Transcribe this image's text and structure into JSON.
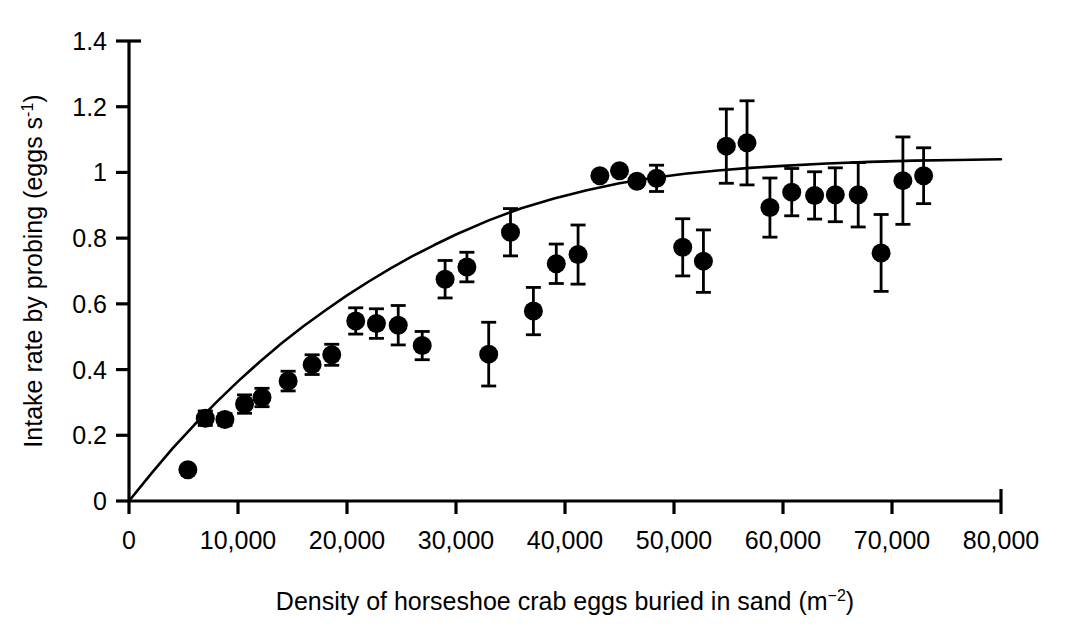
{
  "chart_data": {
    "type": "scatter",
    "title": "",
    "xlabel": "Density of horseshoe crab eggs buried in sand (m−2)",
    "ylabel": "Intake rate by probing (eggs s−1)",
    "xlabel_main": "Density of horseshoe crab eggs buried in sand (m",
    "xlabel_sup": "−2",
    "xlabel_tail": ")",
    "ylabel_main": "Intake rate by probing (eggs s",
    "ylabel_sup": "-1",
    "ylabel_tail": ")",
    "xlim": [
      0,
      80000
    ],
    "ylim": [
      0,
      1.4
    ],
    "grid": false,
    "legend": null,
    "xticks": [
      0,
      10000,
      20000,
      30000,
      40000,
      50000,
      60000,
      70000,
      80000
    ],
    "xticklabels": [
      "0",
      "10,000",
      "20,000",
      "30,000",
      "40,000",
      "50,000",
      "60,000",
      "70,000",
      "80,000"
    ],
    "yticks": [
      0,
      0.2,
      0.4,
      0.6,
      0.8,
      1.0,
      1.2,
      1.4
    ],
    "yticklabels": [
      "0",
      "0.2",
      "0.4",
      "0.6",
      "0.8",
      "1",
      "1.2",
      "1.4"
    ],
    "marker": "filled-circle",
    "marker_color": "#000000",
    "errorbar_type": "symmetric-vertical",
    "series": [
      {
        "name": "Intake rate by probing",
        "points": [
          {
            "x": 5400,
            "y": 0.095,
            "err": 0.0
          },
          {
            "x": 7000,
            "y": 0.252,
            "err": 0.022
          },
          {
            "x": 8800,
            "y": 0.248,
            "err": 0.018
          },
          {
            "x": 10600,
            "y": 0.295,
            "err": 0.028
          },
          {
            "x": 12200,
            "y": 0.315,
            "err": 0.028
          },
          {
            "x": 14600,
            "y": 0.365,
            "err": 0.03
          },
          {
            "x": 16800,
            "y": 0.415,
            "err": 0.03
          },
          {
            "x": 18600,
            "y": 0.445,
            "err": 0.032
          },
          {
            "x": 20800,
            "y": 0.548,
            "err": 0.04
          },
          {
            "x": 22700,
            "y": 0.54,
            "err": 0.045
          },
          {
            "x": 24700,
            "y": 0.535,
            "err": 0.06
          },
          {
            "x": 26900,
            "y": 0.473,
            "err": 0.043
          },
          {
            "x": 29000,
            "y": 0.675,
            "err": 0.057
          },
          {
            "x": 31000,
            "y": 0.712,
            "err": 0.045
          },
          {
            "x": 33000,
            "y": 0.447,
            "err": 0.097
          },
          {
            "x": 35000,
            "y": 0.818,
            "err": 0.072
          },
          {
            "x": 37100,
            "y": 0.578,
            "err": 0.072
          },
          {
            "x": 39200,
            "y": 0.722,
            "err": 0.06
          },
          {
            "x": 41200,
            "y": 0.75,
            "err": 0.09
          },
          {
            "x": 43200,
            "y": 0.99,
            "err": 0.0
          },
          {
            "x": 45000,
            "y": 1.005,
            "err": 0.0
          },
          {
            "x": 46600,
            "y": 0.973,
            "err": 0.0
          },
          {
            "x": 48400,
            "y": 0.982,
            "err": 0.04
          },
          {
            "x": 50800,
            "y": 0.772,
            "err": 0.087
          },
          {
            "x": 52700,
            "y": 0.73,
            "err": 0.095
          },
          {
            "x": 54800,
            "y": 1.08,
            "err": 0.113
          },
          {
            "x": 56700,
            "y": 1.09,
            "err": 0.128
          },
          {
            "x": 58800,
            "y": 0.893,
            "err": 0.09
          },
          {
            "x": 60800,
            "y": 0.94,
            "err": 0.072
          },
          {
            "x": 62900,
            "y": 0.93,
            "err": 0.072
          },
          {
            "x": 64800,
            "y": 0.932,
            "err": 0.082
          },
          {
            "x": 66900,
            "y": 0.932,
            "err": 0.098
          },
          {
            "x": 69000,
            "y": 0.755,
            "err": 0.117
          },
          {
            "x": 71000,
            "y": 0.975,
            "err": 0.133
          },
          {
            "x": 72900,
            "y": 0.99,
            "err": 0.085
          }
        ]
      }
    ],
    "fit_curve": {
      "name": "fitted-response-curve",
      "form": "asymptotic",
      "points": [
        {
          "x": 0,
          "y": 0.0
        },
        {
          "x": 2000,
          "y": 0.082
        },
        {
          "x": 4000,
          "y": 0.16
        },
        {
          "x": 6000,
          "y": 0.232
        },
        {
          "x": 8000,
          "y": 0.3
        },
        {
          "x": 10000,
          "y": 0.364
        },
        {
          "x": 12000,
          "y": 0.424
        },
        {
          "x": 14000,
          "y": 0.48
        },
        {
          "x": 16000,
          "y": 0.532
        },
        {
          "x": 18000,
          "y": 0.58
        },
        {
          "x": 20000,
          "y": 0.626
        },
        {
          "x": 22000,
          "y": 0.668
        },
        {
          "x": 24000,
          "y": 0.708
        },
        {
          "x": 26000,
          "y": 0.745
        },
        {
          "x": 28000,
          "y": 0.779
        },
        {
          "x": 30000,
          "y": 0.811
        },
        {
          "x": 33000,
          "y": 0.854
        },
        {
          "x": 36000,
          "y": 0.891
        },
        {
          "x": 39000,
          "y": 0.921
        },
        {
          "x": 42000,
          "y": 0.946
        },
        {
          "x": 45000,
          "y": 0.967
        },
        {
          "x": 48000,
          "y": 0.983
        },
        {
          "x": 51000,
          "y": 0.996
        },
        {
          "x": 54000,
          "y": 1.006
        },
        {
          "x": 57000,
          "y": 1.014
        },
        {
          "x": 60000,
          "y": 1.02
        },
        {
          "x": 64000,
          "y": 1.027
        },
        {
          "x": 68000,
          "y": 1.032
        },
        {
          "x": 72000,
          "y": 1.036
        },
        {
          "x": 76000,
          "y": 1.038
        },
        {
          "x": 80000,
          "y": 1.04
        }
      ]
    }
  }
}
